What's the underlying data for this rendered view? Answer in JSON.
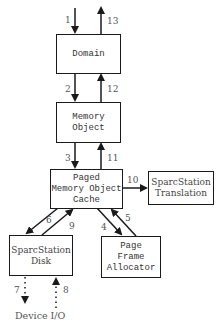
{
  "boxes": {
    "domain": "Domain",
    "memory_object": "Memory\nObject",
    "paged_cache": "Paged\nMemory Object\nCache",
    "translation": "SparcStation\nTranslation",
    "disk": "SparcStation\nDisk",
    "allocator": "Page\nFrame\nAllocator"
  },
  "external": {
    "device_io": "Device I/O"
  },
  "edges": {
    "e1": "1",
    "e2": "2",
    "e3": "3",
    "e4": "4",
    "e5": "5",
    "e6": "6",
    "e7": "7",
    "e8": "8",
    "e9": "9",
    "e10": "10",
    "e11": "11",
    "e12": "12",
    "e13": "13"
  },
  "colors": {
    "stroke": "#1a1a1a",
    "label": "#555555"
  }
}
